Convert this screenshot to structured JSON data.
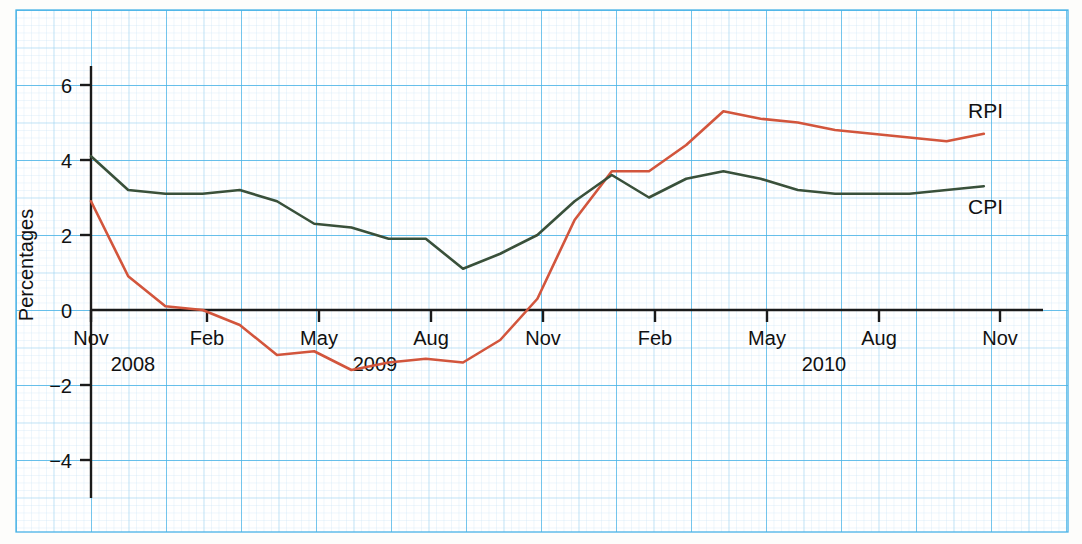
{
  "chart_data": {
    "type": "line",
    "title": "",
    "xlabel": "",
    "ylabel": "Percentages",
    "ylim": [
      -5,
      6.9
    ],
    "yticks": [
      6,
      4,
      2,
      0,
      -2,
      -4
    ],
    "ytick_labels": [
      "6",
      "4",
      "2",
      "0",
      "−2",
      "−4"
    ],
    "grid": true,
    "grid_style": "graph-paper light blue, minor 0.1 / medium 0.5 / major 1 unit",
    "legend_position": "inline-right-of-line-ends",
    "x": [
      "Nov 2008",
      "Dec 2008",
      "Jan 2009",
      "Feb 2009",
      "Mar 2009",
      "Apr 2009",
      "May 2009",
      "Jun 2009",
      "Jul 2009",
      "Aug 2009",
      "Sep 2009",
      "Oct 2009",
      "Nov 2009",
      "Dec 2009",
      "Jan 2010",
      "Feb 2010",
      "Mar 2010",
      "Apr 2010",
      "May 2010",
      "Jun 2010",
      "Jul 2010",
      "Aug 2010",
      "Sep 2010",
      "Oct 2010",
      "Nov 2010"
    ],
    "xticks": [
      "Nov",
      "Feb",
      "May",
      "Aug",
      "Nov",
      "Feb",
      "May",
      "Aug",
      "Nov"
    ],
    "xtick_positions": [
      "Nov 2008",
      "Feb 2009",
      "May 2009",
      "Aug 2009",
      "Nov 2009",
      "Feb 2010",
      "May 2010",
      "Aug 2010",
      "Nov 2010"
    ],
    "year_labels": [
      {
        "text": "2008",
        "at": "Dec 2008"
      },
      {
        "text": "2009",
        "at": "Jun 2009"
      },
      {
        "text": "2010",
        "at": "Jun 2010"
      }
    ],
    "series": [
      {
        "name": "RPI",
        "color": "#d2553c",
        "values": [
          2.9,
          0.9,
          0.1,
          0.0,
          -0.4,
          -1.2,
          -1.1,
          -1.6,
          -1.4,
          -1.3,
          -1.4,
          -0.8,
          0.3,
          2.4,
          3.7,
          3.7,
          4.4,
          5.3,
          5.1,
          5.0,
          4.8,
          4.7,
          4.6,
          4.5,
          4.7
        ]
      },
      {
        "name": "CPI",
        "color": "#39503a",
        "values": [
          4.1,
          3.2,
          3.1,
          3.1,
          3.2,
          2.9,
          2.3,
          2.2,
          1.9,
          1.9,
          1.1,
          1.5,
          2.0,
          2.9,
          3.6,
          3.0,
          3.5,
          3.7,
          3.5,
          3.2,
          3.1,
          3.1,
          3.1,
          3.2,
          3.3
        ]
      }
    ],
    "series_end_labels": [
      {
        "text": "RPI",
        "series": "RPI"
      },
      {
        "text": "CPI",
        "series": "CPI"
      }
    ]
  },
  "axes": {
    "y_axis_title": "Percentages"
  }
}
